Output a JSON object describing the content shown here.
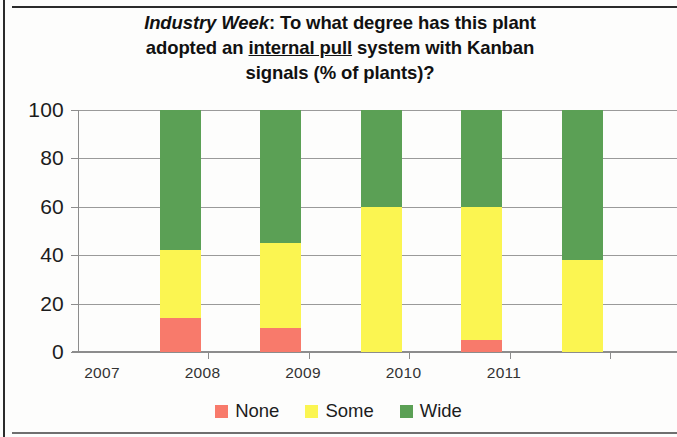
{
  "chart_data": {
    "type": "bar",
    "subtype": "stacked-column-100",
    "title": "Industry Week: To what degree has this plant adopted an internal pull system with Kanban signals (% of plants)?",
    "title_parts": {
      "source_italic": "Industry Week",
      "after_source": ": To what degree has this plant",
      "line2_before_underline": "adopted an ",
      "underlined": "internal pull",
      "line2_after_underline": " system with Kanban",
      "line3": "signals (% of plants)?"
    },
    "xlabel": "",
    "ylabel": "",
    "categories": [
      "2007",
      "2008",
      "2009",
      "2010",
      "2011"
    ],
    "ylim": [
      0,
      100
    ],
    "yticks": [
      0,
      20,
      40,
      60,
      80,
      100
    ],
    "ytick_labels": [
      "0",
      "20",
      "40",
      "60",
      "80",
      "100"
    ],
    "grid": true,
    "grid_axis": "y",
    "legend_position": "bottom",
    "series": [
      {
        "name": "None",
        "color": "#f87a6b",
        "values": [
          14,
          10,
          0,
          5,
          0
        ]
      },
      {
        "name": "Some",
        "color": "#fbf551",
        "values": [
          28,
          35,
          60,
          55,
          38
        ]
      },
      {
        "name": "Wide",
        "color": "#5ba055",
        "values": [
          58,
          55,
          40,
          40,
          62
        ]
      }
    ],
    "cumulative_tops": {
      "None": [
        14,
        10,
        0,
        5,
        0
      ],
      "Some": [
        42,
        45,
        60,
        60,
        38
      ],
      "Wide": [
        100,
        100,
        100,
        100,
        100
      ]
    }
  },
  "legend": {
    "items": [
      {
        "label": "None",
        "color": "#f87a6b"
      },
      {
        "label": "Some",
        "color": "#fbf551"
      },
      {
        "label": "Wide",
        "color": "#5ba055"
      }
    ]
  }
}
